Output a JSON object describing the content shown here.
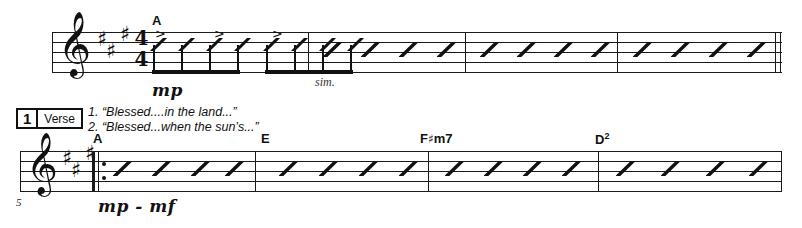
{
  "document": {
    "type": "lead-sheet",
    "key_signature": "A major (3 sharps)",
    "time_signature": {
      "numerator": "4",
      "denominator": "4"
    }
  },
  "systems": [
    {
      "id": "system-1",
      "clef": "treble-clef",
      "sharps": 3,
      "measure_number": "",
      "rehearsal_chord": "A",
      "directions": [
        {
          "name": "dynamic-mp",
          "text": "mp"
        },
        {
          "name": "direction-sim",
          "text": "sim."
        }
      ],
      "accents": [
        ">",
        ">",
        ">"
      ],
      "end_barline": "double",
      "measures": [
        {
          "beats": 8,
          "style": "beamed-eighth-slashes"
        },
        {
          "beats": 4,
          "style": "slash"
        },
        {
          "beats": 4,
          "style": "slash"
        },
        {
          "beats": 4,
          "style": "slash"
        }
      ]
    },
    {
      "id": "system-2",
      "clef": "treble-clef",
      "sharps": 3,
      "measure_number": "5",
      "start_barline": "repeat-start",
      "directions": [
        {
          "name": "dynamic-mp-mf",
          "text": "mp - mf"
        }
      ],
      "chords": [
        {
          "root": "A",
          "quality": "",
          "accidental": "",
          "superscript": ""
        },
        {
          "root": "E",
          "quality": "",
          "accidental": "",
          "superscript": ""
        },
        {
          "root": "F",
          "accidental": "♯",
          "quality": "m7",
          "superscript": ""
        },
        {
          "root": "D",
          "accidental": "",
          "quality": "",
          "superscript": "2"
        }
      ],
      "measures": [
        {
          "beats": 4,
          "style": "slash"
        },
        {
          "beats": 4,
          "style": "slash"
        },
        {
          "beats": 4,
          "style": "slash"
        },
        {
          "beats": 4,
          "style": "slash"
        }
      ]
    }
  ],
  "verse_marker": {
    "number": "1",
    "label": "Verse"
  },
  "lyrics": [
    {
      "number": "1.",
      "text": "“Blessed....in the land...”"
    },
    {
      "number": "2.",
      "text": "“Blessed...when the sun’s...”"
    }
  ],
  "glyphs": {
    "treble_clef": "𝄞",
    "sharp": "♯",
    "accent": ">"
  },
  "colors": {
    "ink": "#111111",
    "paper": "#ffffff"
  }
}
